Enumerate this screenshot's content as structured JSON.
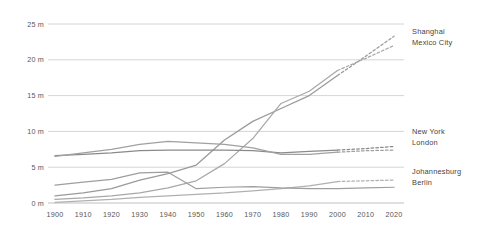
{
  "chart_data": {
    "type": "line",
    "title": "",
    "subtitle": "",
    "xlabel": "",
    "ylabel": "",
    "xlim": [
      1900,
      2020
    ],
    "ylim": [
      0,
      25
    ],
    "grid": true,
    "legend_position": "right-inline",
    "y_ticks": [
      0,
      5,
      10,
      15,
      20,
      25
    ],
    "y_tick_labels": [
      "0 m",
      "5 m",
      "10 m",
      "15 m",
      "20 m",
      "25 m"
    ],
    "x_ticks": [
      1900,
      1910,
      1920,
      1930,
      1940,
      1950,
      1960,
      1970,
      1980,
      1990,
      2000,
      2010,
      2020
    ],
    "x_tick_labels": [
      "1900",
      "1910",
      "1920",
      "1930",
      "1940",
      "1950",
      "1960",
      "1970",
      "1980",
      "1990",
      "2000",
      "2010",
      "2020"
    ],
    "projection_note": "values from 2000 onward are drawn as dashed projections",
    "series": [
      {
        "name": "Shanghai",
        "color": "#9a9a9a",
        "style": "solid-then-dashed",
        "solid_until": 2000,
        "x": [
          1900,
          1910,
          1920,
          1930,
          1940,
          1950,
          1960,
          1970,
          1980,
          1990,
          2000,
          2010,
          2020
        ],
        "values": [
          1.0,
          1.4,
          2.0,
          3.2,
          4.1,
          5.3,
          8.8,
          11.4,
          13.2,
          15.0,
          17.8,
          20.5,
          23.3
        ]
      },
      {
        "name": "Mexico City",
        "color": "#a8a8a8",
        "style": "solid-then-dashed",
        "solid_until": 2000,
        "x": [
          1900,
          1910,
          1920,
          1930,
          1940,
          1950,
          1960,
          1970,
          1980,
          1990,
          2000,
          2010,
          2020
        ],
        "values": [
          0.5,
          0.7,
          1.0,
          1.4,
          2.1,
          3.1,
          5.5,
          9.0,
          13.9,
          15.6,
          18.5,
          20.2,
          22.0
        ]
      },
      {
        "name": "New York",
        "color": "#8a8a8a",
        "style": "solid-then-dashed",
        "solid_until": 2000,
        "x": [
          1900,
          1910,
          1920,
          1930,
          1940,
          1950,
          1960,
          1970,
          1980,
          1990,
          2000,
          2010,
          2020
        ],
        "values": [
          6.6,
          6.8,
          7.0,
          7.3,
          7.4,
          7.4,
          7.4,
          7.3,
          7.0,
          7.2,
          7.4,
          7.6,
          7.9
        ]
      },
      {
        "name": "London",
        "color": "#a0a0a0",
        "style": "solid-then-dashed",
        "solid_until": 2000,
        "x": [
          1900,
          1910,
          1920,
          1930,
          1940,
          1950,
          1960,
          1970,
          1980,
          1990,
          2000,
          2010,
          2020
        ],
        "values": [
          6.5,
          7.0,
          7.5,
          8.2,
          8.6,
          8.4,
          8.2,
          7.7,
          6.8,
          6.8,
          7.1,
          7.3,
          7.4
        ]
      },
      {
        "name": "Johannesburg",
        "color": "#b0b0b0",
        "style": "solid-then-dashed",
        "solid_until": 2000,
        "x": [
          1900,
          1910,
          1920,
          1930,
          1940,
          1950,
          1960,
          1970,
          1980,
          1990,
          2000,
          2010,
          2020
        ],
        "values": [
          0.1,
          0.3,
          0.5,
          0.8,
          1.0,
          1.2,
          1.4,
          1.7,
          2.0,
          2.4,
          3.0,
          3.1,
          3.2
        ]
      },
      {
        "name": "Berlin",
        "color": "#9e9e9e",
        "style": "solid",
        "solid_until": 2020,
        "x": [
          1900,
          1910,
          1920,
          1930,
          1940,
          1950,
          1960,
          1970,
          1980,
          1990,
          2000,
          2010,
          2020
        ],
        "values": [
          2.5,
          2.9,
          3.3,
          4.2,
          4.3,
          2.0,
          2.2,
          2.3,
          2.1,
          2.0,
          2.0,
          2.1,
          2.2
        ]
      }
    ],
    "label_groups": [
      {
        "id": "top",
        "labels": [
          "Shanghai",
          "Mexico City"
        ]
      },
      {
        "id": "middle",
        "labels": [
          "New York",
          "London"
        ]
      },
      {
        "id": "bottom",
        "labels": [
          "Johannesburg",
          "Berlin"
        ]
      }
    ]
  }
}
